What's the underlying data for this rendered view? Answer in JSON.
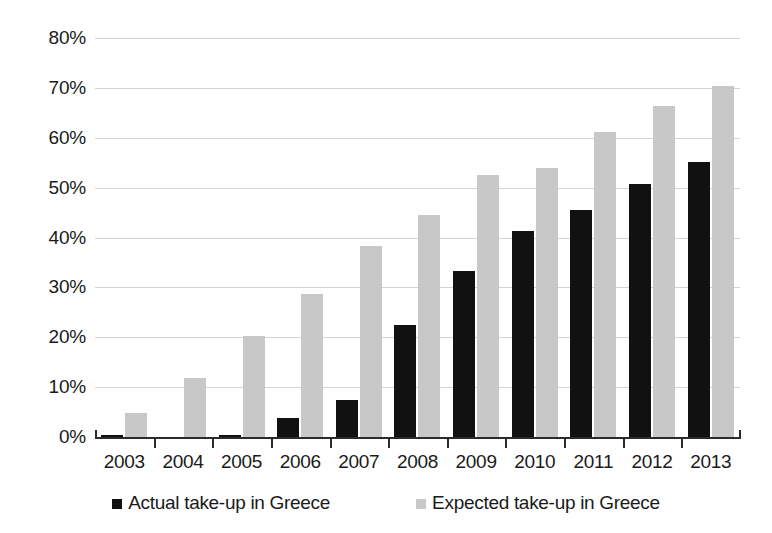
{
  "chart_data": {
    "type": "bar",
    "title": "",
    "subtitle": "",
    "xlabel": "",
    "ylabel": "",
    "categories": [
      "2003",
      "2004",
      "2005",
      "2006",
      "2007",
      "2008",
      "2009",
      "2010",
      "2011",
      "2012",
      "2013"
    ],
    "series": [
      {
        "name": "Actual take-up in Greece",
        "color": "#111111",
        "values": [
          0.5,
          0.0,
          0.5,
          3.8,
          7.4,
          22.5,
          33.3,
          41.4,
          45.5,
          50.7,
          55.2
        ]
      },
      {
        "name": "Expected take-up in Greece",
        "color": "#c8c8c8",
        "values": [
          4.9,
          11.9,
          20.2,
          28.6,
          38.2,
          44.6,
          52.5,
          54.0,
          61.1,
          66.4,
          70.3
        ]
      }
    ],
    "ylim": [
      0,
      80
    ],
    "y_ticks": [
      0,
      10,
      20,
      30,
      40,
      50,
      60,
      70,
      80
    ],
    "y_tick_labels": [
      "0%",
      "10%",
      "20%",
      "30%",
      "40%",
      "50%",
      "60%",
      "70%",
      "80%"
    ],
    "y_tick_suffix": "%",
    "grid": true,
    "grid_axis": "y",
    "grid_color": "#d4d4d4",
    "legend_position": "bottom",
    "legend": [
      "Actual take-up in Greece",
      "Expected take-up in Greece"
    ],
    "axis_color": "#2b2b2b",
    "background": "#ffffff"
  }
}
